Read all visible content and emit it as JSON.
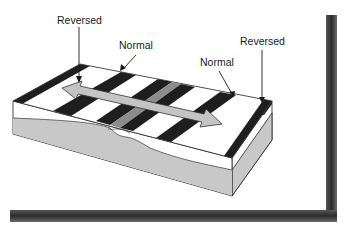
{
  "figure": {
    "labels": {
      "reversed_left": "Reversed",
      "normal_left": "Normal",
      "normal_right": "Normal",
      "reversed_right": "Reversed"
    },
    "colors": {
      "background": "#ffffff",
      "reversed_stripe": "#1e1e1e",
      "ridge_stripe": "#8c8c8c",
      "normal_face": "#ffffff",
      "crust_side": "#c8c8c8",
      "arrow_fill": "#c4c4c4",
      "shadow_frame": "#3a3a3a"
    },
    "elements": [
      "block-diagram",
      "magnetic-stripes",
      "spreading-arrow",
      "shadow-frame"
    ]
  }
}
